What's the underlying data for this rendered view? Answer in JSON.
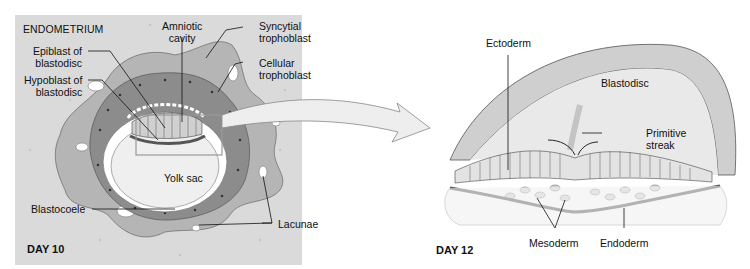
{
  "figure": {
    "left_panel": {
      "region_label": "ENDOMETRIUM",
      "day_label": "DAY 10",
      "labels": {
        "amniotic_cavity": "Amniotic\ncavity",
        "amniotic_cavity_l1": "Amniotic",
        "amniotic_cavity_l2": "cavity",
        "syncytial_l1": "Syncytial",
        "syncytial_l2": "trophoblast",
        "cellular_l1": "Cellular",
        "cellular_l2": "trophoblast",
        "epiblast_l1": "Epiblast of",
        "epiblast_l2": "blastodisc",
        "hypoblast_l1": "Hypoblast of",
        "hypoblast_l2": "blastodisc",
        "yolk_sac": "Yolk sac",
        "blastocoele": "Blastocoele",
        "lacunae": "Lacunae"
      }
    },
    "right_panel": {
      "day_label": "DAY 12",
      "labels": {
        "ectoderm": "Ectoderm",
        "blastodisc": "Blastodisc",
        "primitive_l1": "Primitive",
        "primitive_l2": "streak",
        "mesoderm": "Mesoderm",
        "endoderm": "Endoderm"
      }
    },
    "colors": {
      "background": "#ffffff",
      "endometrium": "#dcdcdc",
      "syncytial": "#b4b4b4",
      "cellular": "#8a8a8a",
      "yolk_sac": "#f2f2f2",
      "line": "#111111"
    }
  }
}
